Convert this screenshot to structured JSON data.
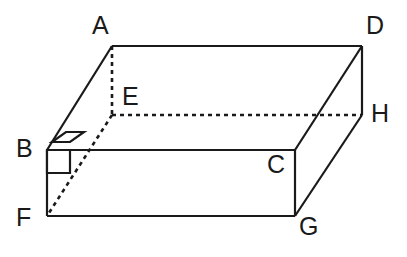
{
  "figure": {
    "kind": "rectangular-prism-net-diagram",
    "background_color": "#ffffff",
    "stroke_color": "#1a1a1a",
    "label_color": "#1a1a1a",
    "solid_stroke_width": 2.2,
    "hidden_stroke_width": 2.6,
    "hidden_dash_pattern": "4 4"
  },
  "vertices": [
    {
      "id": "A",
      "label": "A",
      "x": 112,
      "y": 46,
      "label_x": 92,
      "label_y": 13,
      "hidden": false
    },
    {
      "id": "D",
      "label": "D",
      "x": 362,
      "y": 46,
      "label_x": 366,
      "label_y": 13,
      "hidden": false
    },
    {
      "id": "E",
      "label": "E",
      "x": 112,
      "y": 115,
      "label_x": 122,
      "label_y": 84,
      "hidden": true
    },
    {
      "id": "H",
      "label": "H",
      "x": 362,
      "y": 115,
      "label_x": 371,
      "label_y": 101,
      "hidden": false
    },
    {
      "id": "B",
      "label": "B",
      "x": 47,
      "y": 150,
      "label_x": 16,
      "label_y": 136,
      "hidden": false
    },
    {
      "id": "C",
      "label": "C",
      "x": 295,
      "y": 150,
      "label_x": 267,
      "label_y": 152,
      "hidden": false
    },
    {
      "id": "F",
      "label": "F",
      "x": 47,
      "y": 216,
      "label_x": 16,
      "label_y": 205,
      "hidden": false
    },
    {
      "id": "G",
      "label": "G",
      "x": 295,
      "y": 216,
      "label_x": 299,
      "label_y": 214,
      "hidden": false
    }
  ],
  "edges": [
    {
      "id": "AD",
      "from": "A",
      "to": "D",
      "style": "solid",
      "name": "edge-a-d"
    },
    {
      "id": "AB",
      "from": "A",
      "to": "B",
      "style": "solid",
      "name": "edge-a-b"
    },
    {
      "id": "BC",
      "from": "B",
      "to": "C",
      "style": "solid",
      "name": "edge-b-c"
    },
    {
      "id": "DC",
      "from": "D",
      "to": "C",
      "style": "solid",
      "name": "edge-d-c"
    },
    {
      "id": "BF",
      "from": "B",
      "to": "F",
      "style": "solid",
      "name": "edge-b-f"
    },
    {
      "id": "FG",
      "from": "F",
      "to": "G",
      "style": "solid",
      "name": "edge-f-g"
    },
    {
      "id": "CG",
      "from": "C",
      "to": "G",
      "style": "solid",
      "name": "edge-c-g"
    },
    {
      "id": "DH",
      "from": "D",
      "to": "H",
      "style": "solid",
      "name": "edge-d-h"
    },
    {
      "id": "HG",
      "from": "H",
      "to": "G",
      "style": "solid",
      "name": "edge-h-g"
    },
    {
      "id": "AE",
      "from": "A",
      "to": "E",
      "style": "dashed",
      "name": "edge-a-e-hidden"
    },
    {
      "id": "EH",
      "from": "E",
      "to": "H",
      "style": "dashed",
      "name": "edge-e-h-hidden"
    },
    {
      "id": "EF",
      "from": "E",
      "to": "F",
      "style": "dashed",
      "name": "edge-e-f-hidden"
    }
  ],
  "right_angle_marks": [
    {
      "id": "mark-slanted",
      "name": "right-angle-mark-slanted",
      "at_vertex": "B",
      "points": "52,142 66,132 84,132 70,142",
      "description": "slanted parallelogram right-angle mark above edge BC at B"
    },
    {
      "id": "mark-square",
      "name": "right-angle-mark-square",
      "at_vertex": "B",
      "points": "47,150 70,150 70,173 47,173",
      "description": "square right-angle mark below-right of vertex B"
    }
  ]
}
